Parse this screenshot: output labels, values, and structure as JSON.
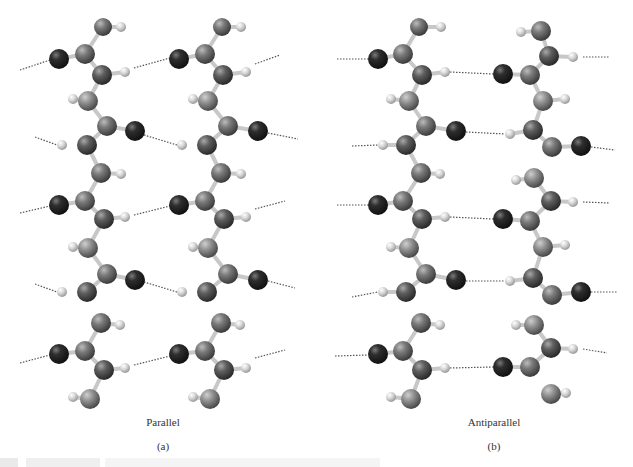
{
  "figure": {
    "panels": [
      {
        "id": "a",
        "title": "Parallel",
        "letter": "(a)"
      },
      {
        "id": "b",
        "title": "Antiparallel",
        "letter": "(b)"
      }
    ],
    "colors": {
      "oxygen": "#2a2a2a",
      "nitrogen": "#5a5a5a",
      "carbon": "#7d7d7d",
      "side_chain": "#9a9a9a",
      "hydrogen": "#d2d2d2",
      "bond": "#c8c8c8",
      "hbond": "#555555"
    },
    "atoms": [
      {
        "p": "a",
        "t": "C",
        "x": 103,
        "y": 27,
        "r": 9
      },
      {
        "p": "a",
        "t": "H",
        "x": 121,
        "y": 27,
        "r": 5
      },
      {
        "p": "a",
        "t": "O",
        "x": 59,
        "y": 59,
        "r": 10
      },
      {
        "p": "a",
        "t": "C",
        "x": 85,
        "y": 54,
        "r": 10
      },
      {
        "p": "a",
        "t": "N",
        "x": 102,
        "y": 75,
        "r": 10
      },
      {
        "p": "a",
        "t": "H",
        "x": 125,
        "y": 72,
        "r": 5
      },
      {
        "p": "a",
        "t": "H",
        "x": 73,
        "y": 99,
        "r": 5
      },
      {
        "p": "a",
        "t": "S",
        "x": 88,
        "y": 101,
        "r": 10
      },
      {
        "p": "a",
        "t": "C",
        "x": 107,
        "y": 126,
        "r": 10
      },
      {
        "p": "a",
        "t": "O",
        "x": 135,
        "y": 131,
        "r": 10
      },
      {
        "p": "a",
        "t": "H",
        "x": 62,
        "y": 145,
        "r": 5
      },
      {
        "p": "a",
        "t": "N",
        "x": 87,
        "y": 145,
        "r": 10
      },
      {
        "p": "a",
        "t": "C",
        "x": 101,
        "y": 173,
        "r": 10
      },
      {
        "p": "a",
        "t": "H",
        "x": 121,
        "y": 174,
        "r": 5
      },
      {
        "p": "a",
        "t": "O",
        "x": 59,
        "y": 205,
        "r": 10
      },
      {
        "p": "a",
        "t": "C",
        "x": 85,
        "y": 201,
        "r": 10
      },
      {
        "p": "a",
        "t": "N",
        "x": 104,
        "y": 219,
        "r": 10
      },
      {
        "p": "a",
        "t": "H",
        "x": 125,
        "y": 217,
        "r": 5
      },
      {
        "p": "a",
        "t": "H",
        "x": 73,
        "y": 247,
        "r": 5
      },
      {
        "p": "a",
        "t": "S",
        "x": 88,
        "y": 248,
        "r": 10
      },
      {
        "p": "a",
        "t": "C",
        "x": 107,
        "y": 274,
        "r": 10
      },
      {
        "p": "a",
        "t": "O",
        "x": 135,
        "y": 280,
        "r": 10
      },
      {
        "p": "a",
        "t": "H",
        "x": 62,
        "y": 292,
        "r": 5
      },
      {
        "p": "a",
        "t": "N",
        "x": 87,
        "y": 292,
        "r": 10
      },
      {
        "p": "a",
        "t": "C",
        "x": 101,
        "y": 323,
        "r": 10
      },
      {
        "p": "a",
        "t": "H",
        "x": 120,
        "y": 325,
        "r": 5
      },
      {
        "p": "a",
        "t": "O",
        "x": 59,
        "y": 354,
        "r": 10
      },
      {
        "p": "a",
        "t": "C",
        "x": 85,
        "y": 351,
        "r": 10
      },
      {
        "p": "a",
        "t": "N",
        "x": 104,
        "y": 370,
        "r": 10
      },
      {
        "p": "a",
        "t": "H",
        "x": 125,
        "y": 368,
        "r": 5
      },
      {
        "p": "a",
        "t": "H",
        "x": 73,
        "y": 397,
        "r": 5
      },
      {
        "p": "a",
        "t": "S",
        "x": 90,
        "y": 399,
        "r": 10
      },
      {
        "p": "a",
        "t": "C",
        "x": 222,
        "y": 27,
        "r": 9
      },
      {
        "p": "a",
        "t": "H",
        "x": 241,
        "y": 27,
        "r": 5
      },
      {
        "p": "a",
        "t": "O",
        "x": 179,
        "y": 59,
        "r": 10
      },
      {
        "p": "a",
        "t": "C",
        "x": 205,
        "y": 54,
        "r": 10
      },
      {
        "p": "a",
        "t": "N",
        "x": 223,
        "y": 75,
        "r": 10
      },
      {
        "p": "a",
        "t": "H",
        "x": 246,
        "y": 72,
        "r": 5
      },
      {
        "p": "a",
        "t": "H",
        "x": 193,
        "y": 99,
        "r": 5
      },
      {
        "p": "a",
        "t": "S",
        "x": 208,
        "y": 101,
        "r": 10
      },
      {
        "p": "a",
        "t": "C",
        "x": 228,
        "y": 126,
        "r": 10
      },
      {
        "p": "a",
        "t": "O",
        "x": 258,
        "y": 131,
        "r": 10
      },
      {
        "p": "a",
        "t": "H",
        "x": 182,
        "y": 145,
        "r": 5
      },
      {
        "p": "a",
        "t": "N",
        "x": 207,
        "y": 145,
        "r": 10
      },
      {
        "p": "a",
        "t": "C",
        "x": 221,
        "y": 173,
        "r": 10
      },
      {
        "p": "a",
        "t": "H",
        "x": 241,
        "y": 174,
        "r": 5
      },
      {
        "p": "a",
        "t": "O",
        "x": 179,
        "y": 205,
        "r": 10
      },
      {
        "p": "a",
        "t": "C",
        "x": 205,
        "y": 201,
        "r": 10
      },
      {
        "p": "a",
        "t": "N",
        "x": 224,
        "y": 219,
        "r": 10
      },
      {
        "p": "a",
        "t": "H",
        "x": 246,
        "y": 217,
        "r": 5
      },
      {
        "p": "a",
        "t": "H",
        "x": 193,
        "y": 247,
        "r": 5
      },
      {
        "p": "a",
        "t": "S",
        "x": 208,
        "y": 248,
        "r": 10
      },
      {
        "p": "a",
        "t": "C",
        "x": 228,
        "y": 274,
        "r": 10
      },
      {
        "p": "a",
        "t": "O",
        "x": 258,
        "y": 280,
        "r": 10
      },
      {
        "p": "a",
        "t": "H",
        "x": 182,
        "y": 292,
        "r": 5
      },
      {
        "p": "a",
        "t": "N",
        "x": 207,
        "y": 292,
        "r": 10
      },
      {
        "p": "a",
        "t": "C",
        "x": 221,
        "y": 323,
        "r": 10
      },
      {
        "p": "a",
        "t": "H",
        "x": 240,
        "y": 325,
        "r": 5
      },
      {
        "p": "a",
        "t": "O",
        "x": 179,
        "y": 354,
        "r": 10
      },
      {
        "p": "a",
        "t": "C",
        "x": 205,
        "y": 351,
        "r": 10
      },
      {
        "p": "a",
        "t": "N",
        "x": 224,
        "y": 370,
        "r": 10
      },
      {
        "p": "a",
        "t": "H",
        "x": 246,
        "y": 368,
        "r": 5
      },
      {
        "p": "a",
        "t": "H",
        "x": 193,
        "y": 397,
        "r": 5
      },
      {
        "p": "a",
        "t": "S",
        "x": 210,
        "y": 399,
        "r": 10
      },
      {
        "p": "b",
        "t": "C",
        "x": 419,
        "y": 27,
        "r": 9
      },
      {
        "p": "b",
        "t": "H",
        "x": 441,
        "y": 27,
        "r": 5
      },
      {
        "p": "b",
        "t": "O",
        "x": 378,
        "y": 59,
        "r": 10
      },
      {
        "p": "b",
        "t": "C",
        "x": 403,
        "y": 54,
        "r": 10
      },
      {
        "p": "b",
        "t": "N",
        "x": 422,
        "y": 75,
        "r": 10
      },
      {
        "p": "b",
        "t": "H",
        "x": 445,
        "y": 72,
        "r": 5
      },
      {
        "p": "b",
        "t": "H",
        "x": 391,
        "y": 99,
        "r": 5
      },
      {
        "p": "b",
        "t": "S",
        "x": 409,
        "y": 101,
        "r": 10
      },
      {
        "p": "b",
        "t": "C",
        "x": 426,
        "y": 126,
        "r": 10
      },
      {
        "p": "b",
        "t": "O",
        "x": 456,
        "y": 131,
        "r": 10
      },
      {
        "p": "b",
        "t": "H",
        "x": 383,
        "y": 145,
        "r": 5
      },
      {
        "p": "b",
        "t": "N",
        "x": 406,
        "y": 145,
        "r": 10
      },
      {
        "p": "b",
        "t": "C",
        "x": 421,
        "y": 173,
        "r": 10
      },
      {
        "p": "b",
        "t": "H",
        "x": 440,
        "y": 174,
        "r": 5
      },
      {
        "p": "b",
        "t": "O",
        "x": 378,
        "y": 205,
        "r": 10
      },
      {
        "p": "b",
        "t": "C",
        "x": 403,
        "y": 201,
        "r": 10
      },
      {
        "p": "b",
        "t": "N",
        "x": 422,
        "y": 219,
        "r": 10
      },
      {
        "p": "b",
        "t": "H",
        "x": 445,
        "y": 217,
        "r": 5
      },
      {
        "p": "b",
        "t": "H",
        "x": 391,
        "y": 247,
        "r": 5
      },
      {
        "p": "b",
        "t": "S",
        "x": 409,
        "y": 248,
        "r": 10
      },
      {
        "p": "b",
        "t": "C",
        "x": 426,
        "y": 274,
        "r": 10
      },
      {
        "p": "b",
        "t": "O",
        "x": 456,
        "y": 280,
        "r": 10
      },
      {
        "p": "b",
        "t": "H",
        "x": 383,
        "y": 292,
        "r": 5
      },
      {
        "p": "b",
        "t": "N",
        "x": 406,
        "y": 292,
        "r": 10
      },
      {
        "p": "b",
        "t": "C",
        "x": 421,
        "y": 323,
        "r": 10
      },
      {
        "p": "b",
        "t": "H",
        "x": 440,
        "y": 325,
        "r": 5
      },
      {
        "p": "b",
        "t": "O",
        "x": 378,
        "y": 354,
        "r": 10
      },
      {
        "p": "b",
        "t": "C",
        "x": 403,
        "y": 351,
        "r": 10
      },
      {
        "p": "b",
        "t": "N",
        "x": 422,
        "y": 370,
        "r": 10
      },
      {
        "p": "b",
        "t": "H",
        "x": 445,
        "y": 368,
        "r": 5
      },
      {
        "p": "b",
        "t": "H",
        "x": 391,
        "y": 397,
        "r": 5
      },
      {
        "p": "b",
        "t": "S",
        "x": 411,
        "y": 399,
        "r": 10
      },
      {
        "p": "b",
        "t": "C",
        "x": 541,
        "y": 31,
        "r": 10
      },
      {
        "p": "b",
        "t": "H",
        "x": 521,
        "y": 32,
        "r": 5
      },
      {
        "p": "b",
        "t": "N",
        "x": 549,
        "y": 56,
        "r": 10
      },
      {
        "p": "b",
        "t": "H",
        "x": 573,
        "y": 57,
        "r": 5
      },
      {
        "p": "b",
        "t": "O",
        "x": 503,
        "y": 74,
        "r": 10
      },
      {
        "p": "b",
        "t": "C",
        "x": 530,
        "y": 75,
        "r": 10
      },
      {
        "p": "b",
        "t": "S",
        "x": 543,
        "y": 101,
        "r": 10
      },
      {
        "p": "b",
        "t": "H",
        "x": 565,
        "y": 99,
        "r": 5
      },
      {
        "p": "b",
        "t": "H",
        "x": 510,
        "y": 134,
        "r": 5
      },
      {
        "p": "b",
        "t": "N",
        "x": 533,
        "y": 130,
        "r": 10
      },
      {
        "p": "b",
        "t": "C",
        "x": 552,
        "y": 147,
        "r": 10
      },
      {
        "p": "b",
        "t": "O",
        "x": 581,
        "y": 146,
        "r": 10
      },
      {
        "p": "b",
        "t": "S",
        "x": 534,
        "y": 178,
        "r": 10
      },
      {
        "p": "b",
        "t": "H",
        "x": 516,
        "y": 180,
        "r": 5
      },
      {
        "p": "b",
        "t": "N",
        "x": 551,
        "y": 201,
        "r": 10
      },
      {
        "p": "b",
        "t": "H",
        "x": 573,
        "y": 202,
        "r": 5
      },
      {
        "p": "b",
        "t": "O",
        "x": 503,
        "y": 219,
        "r": 10
      },
      {
        "p": "b",
        "t": "C",
        "x": 530,
        "y": 221,
        "r": 10
      },
      {
        "p": "b",
        "t": "S",
        "x": 543,
        "y": 247,
        "r": 10
      },
      {
        "p": "b",
        "t": "H",
        "x": 565,
        "y": 245,
        "r": 5
      },
      {
        "p": "b",
        "t": "H",
        "x": 510,
        "y": 281,
        "r": 5
      },
      {
        "p": "b",
        "t": "N",
        "x": 533,
        "y": 278,
        "r": 10
      },
      {
        "p": "b",
        "t": "C",
        "x": 552,
        "y": 295,
        "r": 10
      },
      {
        "p": "b",
        "t": "O",
        "x": 581,
        "y": 292,
        "r": 10
      },
      {
        "p": "b",
        "t": "S",
        "x": 534,
        "y": 325,
        "r": 10
      },
      {
        "p": "b",
        "t": "H",
        "x": 516,
        "y": 325,
        "r": 5
      },
      {
        "p": "b",
        "t": "N",
        "x": 551,
        "y": 348,
        "r": 10
      },
      {
        "p": "b",
        "t": "H",
        "x": 573,
        "y": 349,
        "r": 5
      },
      {
        "p": "b",
        "t": "O",
        "x": 503,
        "y": 367,
        "r": 10
      },
      {
        "p": "b",
        "t": "C",
        "x": 530,
        "y": 367,
        "r": 10
      },
      {
        "p": "b",
        "t": "S",
        "x": 551,
        "y": 394,
        "r": 10
      },
      {
        "p": "b",
        "t": "H",
        "x": 566,
        "y": 393,
        "r": 5
      }
    ],
    "hbonds": [
      [
        20,
        70,
        50,
        60
      ],
      [
        134,
        68,
        170,
        58
      ],
      [
        255,
        64,
        280,
        55
      ],
      [
        35,
        137,
        57,
        145
      ],
      [
        144,
        135,
        177,
        145
      ],
      [
        268,
        133,
        298,
        139
      ],
      [
        20,
        213,
        50,
        206
      ],
      [
        134,
        215,
        170,
        206
      ],
      [
        255,
        209,
        285,
        201
      ],
      [
        35,
        284,
        57,
        292
      ],
      [
        144,
        282,
        177,
        292
      ],
      [
        268,
        281,
        295,
        288
      ],
      [
        20,
        363,
        50,
        355
      ],
      [
        134,
        365,
        170,
        356
      ],
      [
        255,
        358,
        285,
        350
      ],
      [
        337,
        59,
        368,
        59
      ],
      [
        450,
        72,
        493,
        74
      ],
      [
        583,
        57,
        610,
        57
      ],
      [
        352,
        146,
        378,
        145
      ],
      [
        466,
        132,
        505,
        134
      ],
      [
        591,
        147,
        615,
        150
      ],
      [
        337,
        205,
        368,
        205
      ],
      [
        450,
        217,
        493,
        219
      ],
      [
        583,
        202,
        610,
        203
      ],
      [
        352,
        297,
        378,
        292
      ],
      [
        466,
        281,
        505,
        281
      ],
      [
        591,
        292,
        618,
        292
      ],
      [
        335,
        356,
        368,
        355
      ],
      [
        450,
        368,
        493,
        367
      ],
      [
        583,
        349,
        607,
        353
      ]
    ]
  }
}
